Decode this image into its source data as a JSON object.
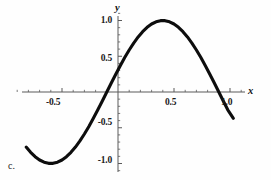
{
  "figure": {
    "panel_label": "c.",
    "background_color": "#fefefe",
    "curve_color": "#0d0d0d",
    "axis_color": "#5a5a5a"
  },
  "axes": {
    "x_name": "x",
    "y_name": "y"
  },
  "chart_data": {
    "type": "line",
    "title": "",
    "subtitle": "",
    "xlabel": "x",
    "ylabel": "y",
    "legend": [],
    "grid": false,
    "annotations": [
      "c."
    ],
    "xlim": [
      -0.9,
      1.15
    ],
    "ylim": [
      -1.12,
      1.12
    ],
    "x_ticks": [
      -0.5,
      0.5,
      1.0
    ],
    "x_tick_labels": [
      "-0.5",
      "0.5",
      "1.0"
    ],
    "y_ticks": [
      -1.0,
      -0.5,
      0.5,
      1.0
    ],
    "y_tick_labels": [
      "-1.0",
      "-0.5",
      "0.5",
      "1.0"
    ],
    "x_minor_tick_step": 0.1,
    "y_minor_tick_step": 0.1,
    "series": [
      {
        "name": "y = sin(pi x)",
        "x": [
          -0.82,
          -0.78,
          -0.74,
          -0.7,
          -0.66,
          -0.62,
          -0.58,
          -0.54,
          -0.5,
          -0.46,
          -0.42,
          -0.38,
          -0.34,
          -0.3,
          -0.26,
          -0.22,
          -0.18,
          -0.14,
          -0.1,
          -0.06,
          -0.02,
          0.02,
          0.06,
          0.1,
          0.14,
          0.18,
          0.22,
          0.26,
          0.3,
          0.34,
          0.38,
          0.42,
          0.46,
          0.5,
          0.54,
          0.58,
          0.62,
          0.66,
          0.7,
          0.74,
          0.78,
          0.82,
          0.86,
          0.9,
          0.94,
          0.98,
          1.03
        ],
        "y": [
          -0.7705,
          -0.8443,
          -0.9048,
          -0.9511,
          -0.9823,
          -0.998,
          -0.998,
          -0.9823,
          -0.9511,
          -0.9048,
          -0.8443,
          -0.7705,
          -0.6845,
          -0.5878,
          -0.4818,
          -0.3681,
          -0.2487,
          -0.1253,
          0.0,
          0.1253,
          0.2487,
          0.3681,
          0.4818,
          0.5878,
          0.6845,
          0.7705,
          0.8443,
          0.9048,
          0.9511,
          0.9823,
          0.998,
          0.998,
          0.9823,
          0.9511,
          0.9048,
          0.8443,
          0.7705,
          0.6845,
          0.5878,
          0.4818,
          0.3681,
          0.2487,
          0.1253,
          0.0,
          -0.1253,
          -0.2487,
          -0.3681
        ]
      }
    ]
  }
}
